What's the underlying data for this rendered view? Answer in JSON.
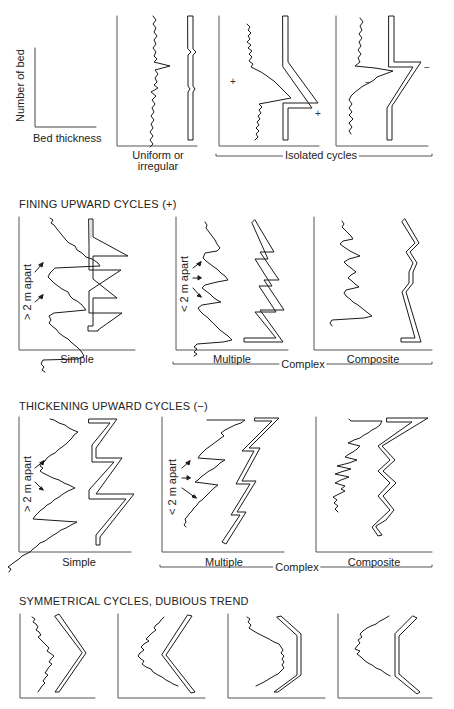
{
  "figure": {
    "legend": {
      "y_axis_label": "Number of bed",
      "x_axis_label": "Bed thickness"
    },
    "row1": {
      "panels": [
        {
          "label": "Uniform or",
          "label2": "irregular"
        },
        {
          "sign_log": "+",
          "sign_profile": "+"
        },
        {
          "sign_log": "−",
          "sign_profile": "−"
        }
      ],
      "group_label": "Isolated cycles"
    },
    "row2": {
      "title": "FINING UPWARD CYCLES (+)",
      "panels": [
        {
          "label": "Simple",
          "spacing_label": "> 2 m apart"
        },
        {
          "label": "Multiple",
          "spacing_label": "< 2 m apart"
        },
        {
          "label": "Composite"
        }
      ],
      "group_label": "Complex"
    },
    "row3": {
      "title": "THICKENING UPWARD CYCLES (−)",
      "panels": [
        {
          "label": "Simple",
          "spacing_label": "> 2 m apart"
        },
        {
          "label": "Multiple",
          "spacing_label": "< 2 m apart"
        },
        {
          "label": "Composite"
        }
      ],
      "group_label": "Complex"
    },
    "row4": {
      "title": "SYMMETRICAL CYCLES, DUBIOUS TREND",
      "panel_count": 4
    },
    "colors": {
      "ink": "#1a1a1a",
      "axis": "#555555",
      "background": "#ffffff"
    }
  }
}
